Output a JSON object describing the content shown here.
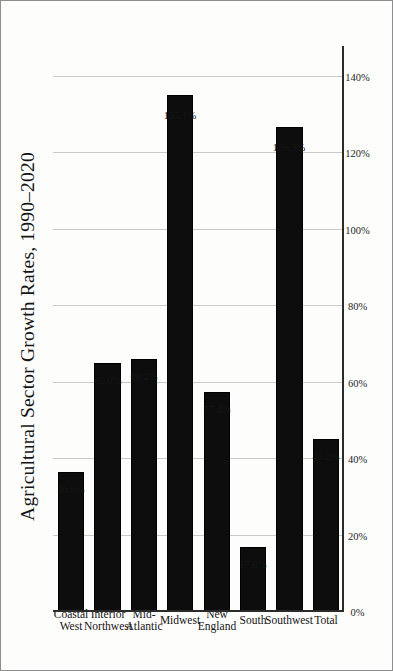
{
  "chart_data": {
    "type": "bar",
    "orientation": "horizontal",
    "title": "Agricultural Sector Growth Rates, 1990–2020",
    "xlabel": "",
    "ylabel": "",
    "categories": [
      "Coastal West",
      "Interior Northwest",
      "Mid-Atlantic",
      "Midwest",
      "New England",
      "South",
      "Southwest",
      "Total"
    ],
    "category_lines": [
      [
        "Coastal",
        "West"
      ],
      [
        "Interior",
        "Northwest"
      ],
      [
        "Mid-",
        "Atlantic"
      ],
      [
        "Midwest"
      ],
      [
        "New",
        "England"
      ],
      [
        "South"
      ],
      [
        "Southwest"
      ],
      [
        "Total"
      ]
    ],
    "values": [
      36.6,
      65.0,
      66.2,
      135.1,
      57.4,
      17.0,
      126.9,
      45.2
    ],
    "value_labels": [
      "36.6%",
      "65.0%",
      "66.2%",
      "135.1%",
      "57.4%",
      "17.0%",
      "126.9%",
      "45.2%"
    ],
    "ticks": [
      0,
      20,
      40,
      60,
      80,
      100,
      120,
      140
    ],
    "tick_labels": [
      "0%",
      "20%",
      "40%",
      "60%",
      "80%",
      "100%",
      "120%",
      "140%"
    ],
    "xlim": [
      0,
      148
    ],
    "grid": true,
    "legend": false,
    "bar_color": "#0d0d0d",
    "grid_color": "#c9c9c9",
    "axis_color": "#2b2b2b",
    "background": "#fdfdfc",
    "page_rotation_degrees": -90
  }
}
